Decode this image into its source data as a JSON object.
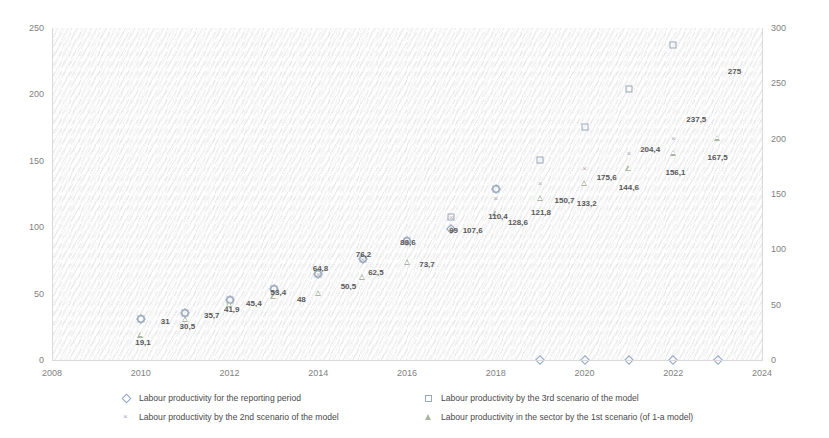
{
  "chart_data": {
    "type": "scatter",
    "title": "",
    "xlabel": "",
    "ylabel": "",
    "xlim": [
      2008,
      2024
    ],
    "ylim": [
      0,
      250
    ],
    "y2lim": [
      0,
      300
    ],
    "grid": false,
    "legend_position": "bottom",
    "x_ticks": [
      "2008",
      "2010",
      "2012",
      "2014",
      "2016",
      "2018",
      "2020",
      "2022",
      "2024"
    ],
    "y_ticks_left": [
      "0",
      "50",
      "100",
      "150",
      "200",
      "250"
    ],
    "y_ticks_right": [
      "0",
      "50",
      "100",
      "150",
      "200",
      "250",
      "300"
    ],
    "series": [
      {
        "name": "Labour productivity for the reporting period",
        "marker": "diamond",
        "color": "#8fa4c4",
        "points": [
          {
            "x": 2010,
            "y": 31
          },
          {
            "x": 2011,
            "y": 35.7
          },
          {
            "x": 2012,
            "y": 45.4
          },
          {
            "x": 2013,
            "y": 53.4
          },
          {
            "x": 2014,
            "y": 64.8
          },
          {
            "x": 2015,
            "y": 76.2
          },
          {
            "x": 2016,
            "y": 89.6
          },
          {
            "x": 2017,
            "y": 99
          },
          {
            "x": 2018,
            "y": 128.6
          },
          {
            "x": 2019,
            "y": 0
          },
          {
            "x": 2020,
            "y": 0
          },
          {
            "x": 2021,
            "y": 0
          },
          {
            "x": 2022,
            "y": 0
          },
          {
            "x": 2023,
            "y": 0
          }
        ]
      },
      {
        "name": "Labour productivity by the 2nd scenario of the model",
        "marker": "cross",
        "color": "#b0a8b8",
        "points": [
          {
            "x": 2014,
            "y": 64.8
          },
          {
            "x": 2015,
            "y": 76.2
          },
          {
            "x": 2016,
            "y": 89.6
          },
          {
            "x": 2017,
            "y": 107.6
          },
          {
            "x": 2018,
            "y": 121.8
          },
          {
            "x": 2019,
            "y": 133.2
          },
          {
            "x": 2020,
            "y": 144.6
          },
          {
            "x": 2021,
            "y": 156.1
          },
          {
            "x": 2022,
            "y": 167.5
          },
          {
            "x": 2023,
            "y": 275
          }
        ]
      },
      {
        "name": "Labour productivity by the 3rd scenario of the model",
        "marker": "square",
        "color": "#9aa7b8",
        "points": [
          {
            "x": 2010,
            "y": 31
          },
          {
            "x": 2011,
            "y": 35.7
          },
          {
            "x": 2012,
            "y": 45.4
          },
          {
            "x": 2013,
            "y": 53.4
          },
          {
            "x": 2014,
            "y": 64.8
          },
          {
            "x": 2015,
            "y": 76.2
          },
          {
            "x": 2016,
            "y": 89.6
          },
          {
            "x": 2017,
            "y": 107.6
          },
          {
            "x": 2018,
            "y": 128.6
          },
          {
            "x": 2019,
            "y": 150.7
          },
          {
            "x": 2020,
            "y": 175.6
          },
          {
            "x": 2021,
            "y": 204.4
          },
          {
            "x": 2022,
            "y": 237.5
          },
          {
            "x": 2023,
            "y": 275
          }
        ]
      },
      {
        "name": "Labour productivity in the sector by the 1st scenario (of 1-a model)",
        "marker": "triangle",
        "color": "#a9b6a0",
        "points": [
          {
            "x": 2010,
            "y": 19.1
          },
          {
            "x": 2011,
            "y": 30.5
          },
          {
            "x": 2012,
            "y": 41.9
          },
          {
            "x": 2013,
            "y": 48
          },
          {
            "x": 2014,
            "y": 50.5
          },
          {
            "x": 2015,
            "y": 62.5
          },
          {
            "x": 2016,
            "y": 73.7
          },
          {
            "x": 2017,
            "y": 99
          },
          {
            "x": 2018,
            "y": 110.4
          },
          {
            "x": 2019,
            "y": 121.8
          },
          {
            "x": 2020,
            "y": 133.2
          },
          {
            "x": 2021,
            "y": 144.6
          },
          {
            "x": 2022,
            "y": 156.1
          },
          {
            "x": 2023,
            "y": 167.5
          }
        ]
      }
    ],
    "data_labels": [
      {
        "text": "19,1",
        "x": 2010.05,
        "y": 13.0
      },
      {
        "text": "31",
        "x": 2010.55,
        "y": 28.5
      },
      {
        "text": "30,5",
        "x": 2011.05,
        "y": 24.5
      },
      {
        "text": "35,7",
        "x": 2011.6,
        "y": 33.5
      },
      {
        "text": "41,9",
        "x": 2012.05,
        "y": 37.5
      },
      {
        "text": "45,4",
        "x": 2012.55,
        "y": 42.0
      },
      {
        "text": "53,4",
        "x": 2013.1,
        "y": 50.5
      },
      {
        "text": "48",
        "x": 2013.62,
        "y": 45.5
      },
      {
        "text": "64,8",
        "x": 2014.05,
        "y": 68.5
      },
      {
        "text": "50,5",
        "x": 2014.68,
        "y": 55.0
      },
      {
        "text": "76,2",
        "x": 2015.02,
        "y": 79.0
      },
      {
        "text": "62,5",
        "x": 2015.3,
        "y": 65.5
      },
      {
        "text": "89,6",
        "x": 2016.02,
        "y": 88.0
      },
      {
        "text": "73,7",
        "x": 2016.45,
        "y": 71.5
      },
      {
        "text": "99",
        "x": 2017.05,
        "y": 97.0
      },
      {
        "text": "107,6",
        "x": 2017.48,
        "y": 97.0
      },
      {
        "text": "110,4",
        "x": 2018.05,
        "y": 108.0
      },
      {
        "text": "128,6",
        "x": 2018.5,
        "y": 103.5
      },
      {
        "text": "121,8",
        "x": 2019.02,
        "y": 110.5
      },
      {
        "text": "150,7",
        "x": 2019.55,
        "y": 119.5
      },
      {
        "text": "133,2",
        "x": 2020.05,
        "y": 117.5
      },
      {
        "text": "175,6",
        "x": 2020.5,
        "y": 137.0
      },
      {
        "text": "144,6",
        "x": 2021.0,
        "y": 129.5
      },
      {
        "text": "204,4",
        "x": 2021.48,
        "y": 158.0
      },
      {
        "text": "156,1",
        "x": 2022.05,
        "y": 140.5
      },
      {
        "text": "237,5",
        "x": 2022.52,
        "y": 180.5
      },
      {
        "text": "167,5",
        "x": 2023.0,
        "y": 152.0
      },
      {
        "text": "275",
        "x": 2023.38,
        "y": 217.0
      }
    ]
  },
  "legend": {
    "items": [
      {
        "label": "Labour productivity for the reporting period",
        "marker": "diamond"
      },
      {
        "label": "Labour productivity by the 2nd scenario of the model",
        "marker": "cross"
      },
      {
        "label": "Labour productivity by the 3rd scenario of the model",
        "marker": "square"
      },
      {
        "label": "Labour productivity in the sector by the 1st scenario (of 1-a model)",
        "marker": "triangle"
      }
    ]
  },
  "colors": {
    "background": "#ffffff",
    "axis": "#d9d9d9",
    "tick_text": "#7f7f7f",
    "label_text": "#585858"
  }
}
